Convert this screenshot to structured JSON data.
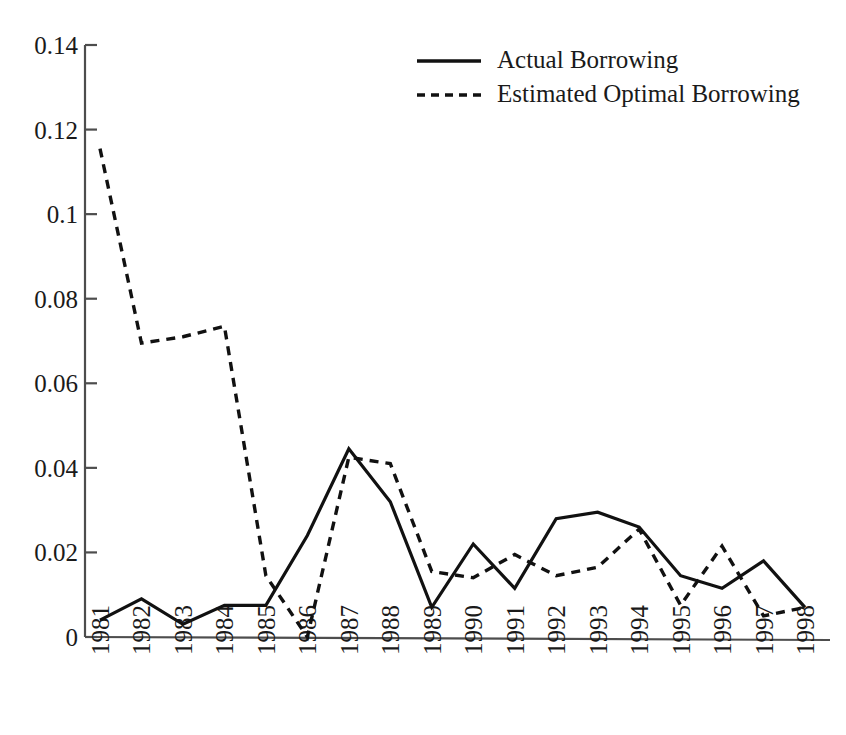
{
  "chart_data": {
    "type": "line",
    "title": "",
    "xlabel": "",
    "ylabel": "",
    "grid": false,
    "legend_position": "top-center",
    "categories": [
      "1981",
      "1982",
      "1983",
      "1984",
      "1985",
      "1986",
      "1987",
      "1988",
      "1989",
      "1990",
      "1991",
      "1992",
      "1993",
      "1994",
      "1995",
      "1996",
      "1997",
      "1998"
    ],
    "xlim": [
      1981,
      1998
    ],
    "ylim": [
      0,
      0.14
    ],
    "ytick_labels": [
      "0",
      "0.02",
      "0.04",
      "0.06",
      "0.08",
      "0.1",
      "0.12",
      "0.14"
    ],
    "ytick_values": [
      0,
      0.02,
      0.04,
      0.06,
      0.08,
      0.1,
      0.12,
      0.14
    ],
    "series": [
      {
        "name": "Actual Borrowing",
        "style": "solid",
        "values": [
          0.004,
          0.009,
          0.003,
          0.0075,
          0.0075,
          0.024,
          0.0445,
          0.032,
          0.007,
          0.022,
          0.0115,
          0.028,
          0.0295,
          0.026,
          0.0145,
          0.0115,
          0.018,
          0.007
        ]
      },
      {
        "name": "Estimated Optimal Borrowing",
        "style": "dashed",
        "values": [
          0.1155,
          0.0695,
          0.071,
          0.0735,
          0.0145,
          0.0,
          0.0425,
          0.041,
          0.0155,
          0.014,
          0.0195,
          0.0145,
          0.0165,
          0.0255,
          0.0075,
          0.0215,
          0.005,
          0.007
        ]
      }
    ]
  },
  "legend": {
    "entries": [
      {
        "label": "Actual Borrowing",
        "style": "solid"
      },
      {
        "label": "Estimated Optimal Borrowing",
        "style": "dashed"
      }
    ]
  }
}
